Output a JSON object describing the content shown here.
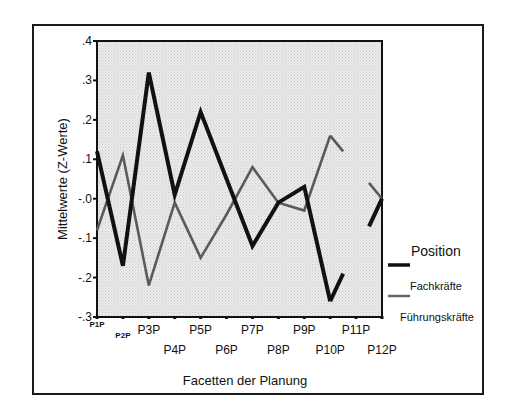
{
  "chart_data": {
    "type": "line",
    "title": "",
    "xlabel": "Facetten der Planung",
    "ylabel": "Mittelwerte (Z-Werte)",
    "categories": [
      "P1P",
      "P2P",
      "P3P",
      "P4P",
      "P5P",
      "P6P",
      "P7P",
      "P8P",
      "P9P",
      "P10P",
      "P11P",
      "P12P"
    ],
    "ylim": [
      -0.3,
      0.4
    ],
    "yticks": [
      0.4,
      0.3,
      0.2,
      0.1,
      0.0,
      -0.1,
      -0.2,
      -0.3
    ],
    "ytick_labels": [
      ".4",
      ".3",
      ".2",
      ".1",
      "-.0",
      "-.1",
      "-.2",
      "-.3"
    ],
    "grid": false,
    "legend": {
      "title": "Position",
      "placement": "right"
    },
    "series": [
      {
        "name": "Fachkräfte",
        "color": "#111111",
        "style": "thick-solid",
        "values": [
          0.12,
          -0.17,
          0.32,
          0.01,
          0.22,
          0.05,
          -0.12,
          -0.01,
          0.03,
          -0.26,
          null,
          0.0
        ],
        "stubs": [
          {
            "from_index": 9,
            "toward_index": 10,
            "value_at_end": -0.19,
            "fraction": 0.5
          },
          {
            "from_index": 11,
            "toward_index": 10,
            "value_at_end": -0.07,
            "fraction": 0.5
          }
        ]
      },
      {
        "name": "Führungskräfte",
        "color": "#555555",
        "style": "thin-gray",
        "values": [
          -0.08,
          0.11,
          -0.22,
          -0.01,
          -0.15,
          -0.04,
          0.08,
          -0.01,
          -0.03,
          0.16,
          null,
          0.0
        ],
        "stubs": [
          {
            "from_index": 9,
            "toward_index": 10,
            "value_at_end": 0.12,
            "fraction": 0.5
          },
          {
            "from_index": 11,
            "toward_index": 10,
            "value_at_end": 0.04,
            "fraction": 0.5
          }
        ]
      }
    ],
    "plot_background": "#e2e2e2"
  }
}
